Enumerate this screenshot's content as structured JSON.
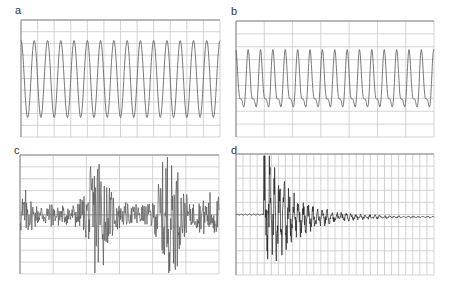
{
  "chart_data": [
    {
      "id": "a",
      "type": "line",
      "title": "a",
      "description": "Regular sinusoidal waveform, constant amplitude",
      "cycles": 15,
      "amplitude": 0.85,
      "grid": {
        "vertical_divisions": 12,
        "horizontal_divisions": 10
      },
      "xlabel": "",
      "ylabel": "",
      "ylim": [
        -1,
        1
      ]
    },
    {
      "id": "b",
      "type": "line",
      "title": "b",
      "description": "Periodic waveform with harmonic distortion (notch near trough)",
      "cycles": 16,
      "amplitude": 0.7,
      "grid": {
        "vertical_divisions": 7,
        "horizontal_divisions": 9
      },
      "xlabel": "",
      "ylabel": "",
      "ylim": [
        -1,
        1
      ]
    },
    {
      "id": "c",
      "type": "line",
      "title": "c",
      "description": "Irregular random-like signal with bursts of large amplitude",
      "grid": {
        "vertical_divisions": 6,
        "horizontal_divisions": 10
      },
      "bursts": [
        0.02,
        0.4,
        0.75
      ],
      "xlabel": "",
      "ylabel": "",
      "ylim": [
        -1,
        1
      ]
    },
    {
      "id": "d",
      "type": "line",
      "title": "d",
      "description": "Impulse response: large initial oscillation decaying to near zero",
      "onset": 0.14,
      "grid": {
        "vertical_divisions": 28,
        "horizontal_divisions": 10
      },
      "xlabel": "",
      "ylabel": "",
      "ylim": [
        -1,
        1
      ]
    }
  ],
  "panels": {
    "a": {
      "label": "a"
    },
    "b": {
      "label": "b"
    },
    "c": {
      "label": "c"
    },
    "d": {
      "label": "d"
    }
  },
  "colors": {
    "grid": "#c8c8c8",
    "axis": "#888888",
    "trace": "#555555",
    "trace_dark": "#222222"
  }
}
